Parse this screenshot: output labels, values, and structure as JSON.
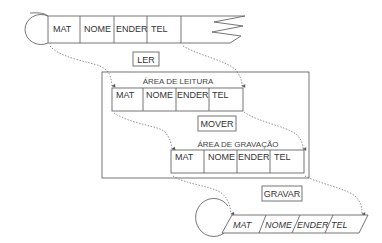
{
  "input_file": {
    "fields": [
      "MAT",
      "NOME",
      "ENDER",
      "TEL"
    ]
  },
  "operations": {
    "read": "LER",
    "move": "MOVER",
    "write": "GRAVAR"
  },
  "memory": {
    "read_area": {
      "title": "ÁREA DE LEITURA",
      "fields": [
        "MAT",
        "NOME",
        "ENDER",
        "TEL"
      ]
    },
    "write_area": {
      "title": "ÁREA DE GRAVAÇÃO",
      "fields": [
        "MAT",
        "NOME",
        "ENDER",
        "TEL"
      ]
    }
  },
  "output_file": {
    "fields": [
      "MAT",
      "NOME",
      "ENDER",
      "TEL"
    ]
  },
  "colors": {
    "stroke": "#666666",
    "text": "#333333",
    "background": "#ffffff"
  }
}
